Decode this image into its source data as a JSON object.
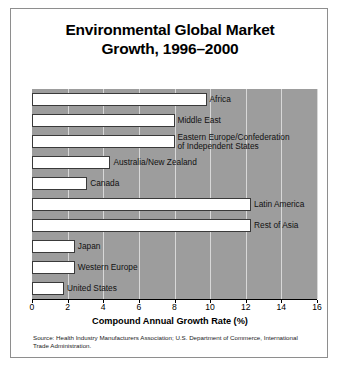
{
  "chart_data": {
    "type": "bar",
    "orientation": "horizontal",
    "title": "Environmental Global Market Growth, 1996–2000",
    "title_line1": "Environmental Global Market",
    "title_line2": "Growth, 1996–2000",
    "xlabel": "Compound Annual Growth Rate (%)",
    "ylabel": "",
    "xlim": [
      0,
      16
    ],
    "xticks": [
      0,
      2,
      4,
      6,
      8,
      10,
      12,
      14,
      16
    ],
    "xtick_labels": [
      "0",
      "2",
      "4",
      "6",
      "8",
      "10",
      "12",
      "14",
      "16"
    ],
    "grid": true,
    "legend": "none",
    "categories": [
      "Africa",
      "Middle East",
      "Eastern Europe/Confederation of Independent States",
      "Australia/New Zealand",
      "Canada",
      "Latin America",
      "Rest of Asia",
      "Japan",
      "Western Europe",
      "United States"
    ],
    "values": [
      9.8,
      8.0,
      8.0,
      4.4,
      3.1,
      12.3,
      12.3,
      2.4,
      2.4,
      1.8
    ],
    "bar_color": "#ffffff",
    "bar_edge_color": "#3a3a3a",
    "plot_background": "#9d9d9d",
    "gridline_color": "#d8d8d8",
    "points": [
      {
        "label": "Africa",
        "label_line1": "Africa",
        "label_line2": "",
        "value": 9.8
      },
      {
        "label": "Middle East",
        "label_line1": "Middle East",
        "label_line2": "",
        "value": 8.0
      },
      {
        "label": "Eastern Europe/Confederation of Independent States",
        "label_line1": "Eastern Europe/Confederation",
        "label_line2": "of Independent States",
        "value": 8.0
      },
      {
        "label": "Australia/New Zealand",
        "label_line1": "Australia/New Zealand",
        "label_line2": "",
        "value": 4.4
      },
      {
        "label": "Canada",
        "label_line1": "Canada",
        "label_line2": "",
        "value": 3.1
      },
      {
        "label": "Latin America",
        "label_line1": "Latin America",
        "label_line2": "",
        "value": 12.3
      },
      {
        "label": "Rest of Asia",
        "label_line1": "Rest of Asia",
        "label_line2": "",
        "value": 12.3
      },
      {
        "label": "Japan",
        "label_line1": "Japan",
        "label_line2": "",
        "value": 2.4
      },
      {
        "label": "Western Europe",
        "label_line1": "Western Europe",
        "label_line2": "",
        "value": 2.4
      },
      {
        "label": "United States",
        "label_line1": "United States",
        "label_line2": "",
        "value": 1.8
      }
    ]
  },
  "source": {
    "text": "Source: Health Industry Manufacturers Association; U.S. Department of Commerce, International Trade Administration."
  }
}
